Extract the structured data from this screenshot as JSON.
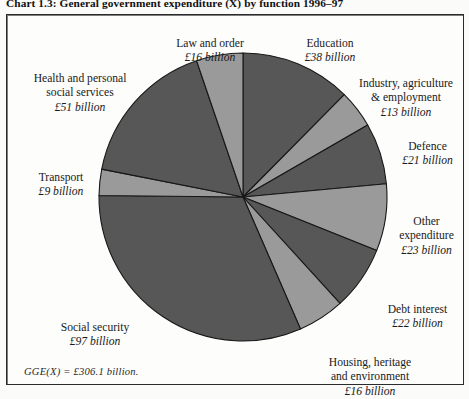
{
  "caption": "Chart 1.3: General government expenditure (X) by function 1996–97",
  "footnote": "GGE(X) = £306.1 billion.",
  "currency_symbol": "£",
  "colors": {
    "slice_dark": "#575757",
    "slice_light": "#9a9a9a",
    "slice_outline": "#181818",
    "frame_border": "#2b2b2b",
    "page_background": "#fdfdfc",
    "text": "#1a1a1a"
  },
  "labels": {
    "law_and_order": {
      "name": "Law and order",
      "amount": "£16 billion"
    },
    "education": {
      "name": "Education",
      "amount": "£38 billion"
    },
    "industry": {
      "name": "Industry, agriculture\n& employment",
      "amount": "£13 billion"
    },
    "defence": {
      "name": "Defence",
      "amount": "£21 billion"
    },
    "other": {
      "name": "Other\nexpenditure",
      "amount": "£23 billion"
    },
    "debt_interest": {
      "name": "Debt interest",
      "amount": "£22 billion"
    },
    "housing": {
      "name": "Housing, heritage\nand environment",
      "amount": "£16 billion"
    },
    "social_security": {
      "name": "Social security",
      "amount": "£97 billion"
    },
    "transport": {
      "name": "Transport",
      "amount": "£9 billion"
    },
    "health": {
      "name": "Health and personal\nsocial services",
      "amount": "£51 billion"
    }
  },
  "chart_data": {
    "type": "pie",
    "title": "Chart 1.3: General government expenditure (X) by function 1996–97",
    "units": "£ billion",
    "total": 306.1,
    "total_label": "GGE(X) = £306.1 billion.",
    "start_angle_deg": 0,
    "direction": "clockwise",
    "legend": "none (labels placed around pie)",
    "categories": [
      "Education",
      "Industry, agriculture & employment",
      "Defence",
      "Other expenditure",
      "Debt interest",
      "Housing, heritage and environment",
      "Social security",
      "Transport",
      "Health and personal social services",
      "Law and order"
    ],
    "values": [
      38,
      13,
      21,
      23,
      22,
      16,
      97,
      9,
      51,
      16
    ],
    "slice_fills": [
      "#575757",
      "#9a9a9a",
      "#575757",
      "#9a9a9a",
      "#575757",
      "#9a9a9a",
      "#575757",
      "#9a9a9a",
      "#575757",
      "#9a9a9a"
    ],
    "geometry": {
      "cx": 243,
      "cy": 197,
      "r": 144
    }
  }
}
